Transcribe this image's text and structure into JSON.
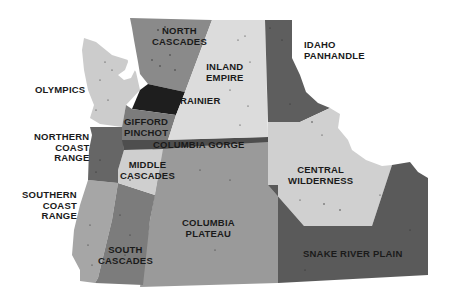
{
  "map": {
    "title": "Pacific Northwest forest / ecological regions",
    "colors": {
      "background": "#ffffff",
      "light": "#d2d2d2",
      "lighter": "#dcdcdc",
      "medium": "#9a9a9a",
      "medium_dark": "#7a7a7a",
      "dark": "#5e5e5e",
      "darker": "#4c4c4c",
      "black": "#1e1e1e",
      "label": "#1a1a1a"
    },
    "regions": [
      {
        "id": "north-cascades",
        "label": "NORTH\nCASCADES",
        "shade": "medium_dark"
      },
      {
        "id": "inland-empire",
        "label": "INLAND\nEMPIRE",
        "shade": "lighter"
      },
      {
        "id": "idaho-panhandle",
        "label": "IDAHO\nPANHANDLE",
        "shade": "dark"
      },
      {
        "id": "olympics",
        "label": "OLYMPICS",
        "shade": "light"
      },
      {
        "id": "rainier",
        "label": "RAINIER",
        "shade": "black"
      },
      {
        "id": "gifford-pinchot",
        "label": "GIFFORD\nPINCHOT",
        "shade": "medium_dark"
      },
      {
        "id": "northern-coast-range",
        "label": "NORTHERN\nCOAST\nRANGE",
        "shade": "dark"
      },
      {
        "id": "columbia-gorge",
        "label": "COLUMBIA GORGE",
        "shade": "darker"
      },
      {
        "id": "middle-cascades",
        "label": "MIDDLE\nCASCADES",
        "shade": "light"
      },
      {
        "id": "central-wilderness",
        "label": "CENTRAL\nWILDERNESS",
        "shade": "light"
      },
      {
        "id": "southern-coast-range",
        "label": "SOUTHERN\nCOAST\nRANGE",
        "shade": "medium"
      },
      {
        "id": "columbia-plateau",
        "label": "COLUMBIA\nPLATEAU",
        "shade": "medium"
      },
      {
        "id": "south-cascades",
        "label": "SOUTH\nCASCADES",
        "shade": "medium_dark"
      },
      {
        "id": "snake-river-plain",
        "label": "SNAKE RIVER PLAIN",
        "shade": "dark"
      }
    ]
  }
}
